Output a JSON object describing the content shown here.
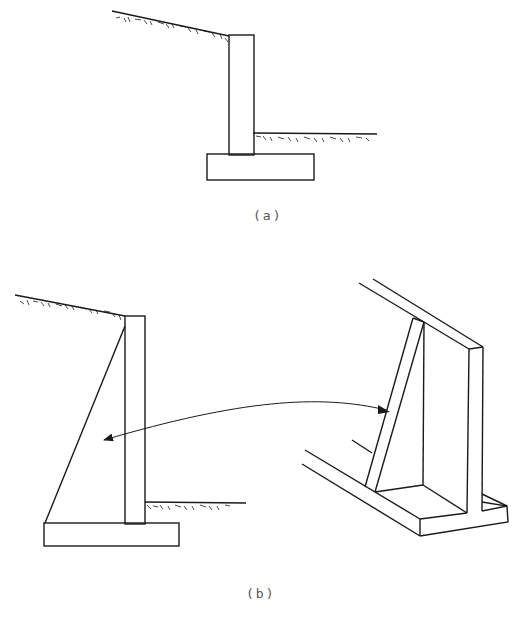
{
  "figure_a": {
    "caption": "(a)",
    "type": "cantilever-retaining-wall-section"
  },
  "figure_b": {
    "caption": "(b)",
    "left_type": "counterfort-retaining-wall-section",
    "right_type": "counterfort-retaining-wall-perspective",
    "connector": "arrow-linking-counterfort"
  },
  "colors": {
    "line": "#1a1a1a",
    "background": "#ffffff",
    "caption": "#555555"
  }
}
